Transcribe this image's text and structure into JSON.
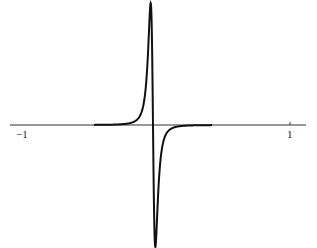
{
  "chart_data": {
    "type": "line",
    "title": "",
    "xlabel": "",
    "ylabel": "",
    "xlim": [
      -1,
      1
    ],
    "grid": false,
    "legend": null,
    "x_ticks": [
      {
        "value": -1,
        "label": "−1"
      },
      {
        "value": 1,
        "label": "1"
      }
    ],
    "series": [
      {
        "name": "curve",
        "description": "odd function: sharp positive peak just left of 0, sharp negative trough just right of 0, decaying to 0 by |x|≈0.45 (derivative-of-Lorentzian shape)",
        "x": [
          -0.45,
          -0.3,
          -0.2,
          -0.12,
          -0.08,
          -0.05,
          -0.03,
          0.0,
          0.03,
          0.05,
          0.08,
          0.12,
          0.2,
          0.3,
          0.45
        ],
        "y": [
          0.0,
          0.02,
          0.06,
          0.15,
          0.3,
          0.7,
          1.0,
          0.0,
          -1.0,
          -0.7,
          -0.3,
          -0.15,
          -0.06,
          -0.02,
          0.0
        ]
      }
    ],
    "colors": {
      "curve": "#111111",
      "axis": "#333333"
    }
  },
  "axis": {
    "left_label": "−1",
    "right_label": "1"
  }
}
